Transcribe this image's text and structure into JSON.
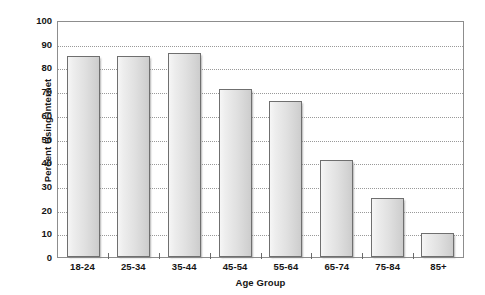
{
  "chart_data": {
    "type": "bar",
    "title": "",
    "subtitle": "",
    "xlabel": "Age Group",
    "ylabel": "Percent Using Internet",
    "categories": [
      "18-24",
      "25-34",
      "35-44",
      "45-54",
      "55-64",
      "65-74",
      "75-84",
      "85+"
    ],
    "values": [
      85,
      85,
      86,
      71,
      66,
      41,
      25,
      10
    ],
    "series": [
      {
        "name": "Percent Using Internet",
        "values": [
          85,
          85,
          86,
          71,
          66,
          41,
          25,
          10
        ]
      }
    ],
    "ylim": [
      0,
      100
    ],
    "ytick_step": 10,
    "ytick_labels": [
      "0",
      "10",
      "20",
      "30",
      "40",
      "50",
      "60",
      "70",
      "80",
      "90",
      "100"
    ],
    "ytick_values": [
      0,
      10,
      20,
      30,
      40,
      50,
      60,
      70,
      80,
      90,
      100
    ],
    "grid": true,
    "grid_orientation": "horizontal",
    "grid_style": "dotted",
    "legend": false,
    "legend_position": "none",
    "annotations": [],
    "colors": {
      "bar_fill_light": "#f6f6f6",
      "bar_fill_dark": "#cccccc",
      "bar_border": "#6f6f6f",
      "gridline": "#999999",
      "frame": "#8d8d8d",
      "text": "#151515",
      "background": "#ffffff"
    }
  }
}
